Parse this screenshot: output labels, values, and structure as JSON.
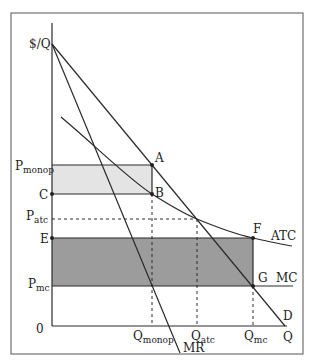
{
  "diagram": {
    "axes": {
      "y_label": "$/Q",
      "x_label": "Q",
      "origin_label": "0"
    },
    "price_labels": {
      "p_monop": {
        "main": "P",
        "sub": "monop"
      },
      "c": "C",
      "p_atc": {
        "main": "P",
        "sub": "atc"
      },
      "e": "E",
      "p_mc": {
        "main": "P",
        "sub": "mc"
      }
    },
    "quantity_labels": {
      "q_monop": {
        "main": "Q",
        "sub": "monop"
      },
      "q_atc": {
        "main": "Q",
        "sub": "atc"
      },
      "q_mc": {
        "main": "Q",
        "sub": "mc"
      }
    },
    "curves": {
      "demand": "D",
      "marginal_revenue": "MR",
      "average_total_cost": "ATC",
      "marginal_cost": "MC"
    },
    "points": {
      "a": "A",
      "b": "B",
      "f": "F",
      "g": "G"
    },
    "colors": {
      "line": "#2a2a2a",
      "profit_area": "#e4e4e4",
      "loss_area": "#9c9c9c",
      "frame": "#555555"
    }
  }
}
